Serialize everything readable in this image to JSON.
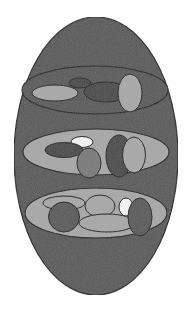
{
  "diagram": {
    "colors": {
      "background": "#ffffff",
      "outline": "#1e1e1e",
      "dark_fill": "#5a5a5a",
      "darker_fill": "#4a4a4a",
      "mid_fill": "#7a7a7a",
      "light_fill": "#a8a8a8",
      "white_fill": "#f4f4f4"
    },
    "outer": {
      "cx": 96,
      "cy": 156,
      "rx": 82,
      "ry": 139,
      "fill": "dark_fill"
    },
    "bands": [
      {
        "name": "top-band",
        "cx": 95,
        "cy": 90,
        "rx": 73,
        "ry": 24,
        "fill": "dark_fill",
        "shapes": [
          {
            "name": "light-horizontal-ellipse",
            "cx": 55,
            "cy": 93,
            "rx": 23,
            "ry": 8,
            "fill": "light_fill"
          },
          {
            "name": "small-dark-ellipse",
            "cx": 80,
            "cy": 83,
            "rx": 11,
            "ry": 5,
            "fill": "darker_fill"
          },
          {
            "name": "dark-wide-ellipse",
            "cx": 106,
            "cy": 92,
            "rx": 22,
            "ry": 10,
            "fill": "darker_fill"
          },
          {
            "name": "light-vertical-ellipse",
            "cx": 130,
            "cy": 93,
            "rx": 12,
            "ry": 19,
            "fill": "light_fill"
          }
        ]
      },
      {
        "name": "middle-band",
        "cx": 96,
        "cy": 152,
        "rx": 73,
        "ry": 23,
        "fill": "light_fill",
        "shapes": [
          {
            "name": "white-ellipse",
            "cx": 82,
            "cy": 142,
            "rx": 11,
            "ry": 5.5,
            "fill": "white_fill"
          },
          {
            "name": "dark-horizontal-ellipse",
            "cx": 64,
            "cy": 150,
            "rx": 19,
            "ry": 7.5,
            "fill": "darker_fill"
          },
          {
            "name": "mid-vertical-ellipse",
            "cx": 89,
            "cy": 163,
            "rx": 12,
            "ry": 15,
            "fill": "mid_fill"
          },
          {
            "name": "dark-vertical-ellipse",
            "cx": 119,
            "cy": 156,
            "rx": 13,
            "ry": 21,
            "fill": "darker_fill"
          },
          {
            "name": "light-vertical-ellipse",
            "cx": 134,
            "cy": 155,
            "rx": 11.5,
            "ry": 18,
            "fill": "light_fill"
          }
        ]
      },
      {
        "name": "bottom-band",
        "cx": 96,
        "cy": 213,
        "rx": 71,
        "ry": 25,
        "fill": "light_fill",
        "shapes": [
          {
            "name": "light-top-left-ellipse",
            "cx": 64,
            "cy": 203,
            "rx": 21,
            "ry": 7,
            "fill": "light_fill"
          },
          {
            "name": "dark-circle",
            "cx": 64,
            "cy": 217,
            "rx": 15.5,
            "ry": 15,
            "fill": "dark_fill"
          },
          {
            "name": "light-top-center-ellipse",
            "cx": 100,
            "cy": 206,
            "rx": 15,
            "ry": 11,
            "fill": "light_fill"
          },
          {
            "name": "light-lower-wide-ellipse",
            "cx": 107,
            "cy": 223,
            "rx": 28,
            "ry": 9,
            "fill": "light_fill"
          },
          {
            "name": "white-ellipse",
            "cx": 126,
            "cy": 207,
            "rx": 7,
            "ry": 9,
            "fill": "white_fill"
          },
          {
            "name": "dark-vertical-ellipse",
            "cx": 140,
            "cy": 217,
            "rx": 12,
            "ry": 19,
            "fill": "dark_fill"
          }
        ]
      }
    ]
  }
}
